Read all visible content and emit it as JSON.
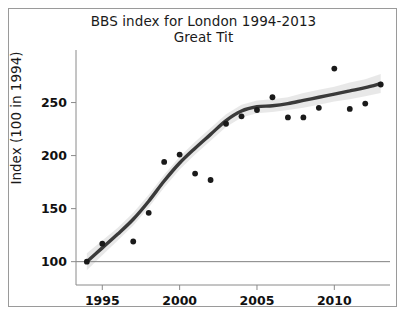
{
  "chart_data": {
    "type": "scatter",
    "title": "BBS index for London 1994-2013",
    "subtitle": "Great Tit",
    "xlabel": "",
    "ylabel": "Index (100 in 1994)",
    "xlim": [
      1993.3,
      2013.6
    ],
    "ylim": [
      78,
      292
    ],
    "grid": false,
    "legend": null,
    "xticks": [
      1995,
      2000,
      2005,
      2010
    ],
    "xtick_labels": [
      "1995",
      "2000",
      "2005",
      "2010"
    ],
    "yticks": [
      100,
      150,
      200,
      250
    ],
    "ytick_labels": [
      "100",
      "150",
      "200",
      "250"
    ],
    "reference_line": {
      "y": 100,
      "color": "#808080",
      "label": ""
    },
    "x": [
      1994,
      1995,
      1997,
      1998,
      1999,
      2000,
      2001,
      2002,
      2003,
      2004,
      2005,
      2006,
      2007,
      2008,
      2009,
      2010,
      2011,
      2012,
      2013
    ],
    "values": [
      100,
      117,
      119,
      146,
      194,
      201,
      183,
      177,
      230,
      237,
      243,
      255,
      236,
      236,
      245,
      282,
      244,
      249,
      267
    ],
    "series": [
      {
        "name": "Annual index",
        "marker": "filled-circle",
        "color": "#1a1a1a",
        "x": [
          1994,
          1995,
          1997,
          1998,
          1999,
          2000,
          2001,
          2002,
          2003,
          2004,
          2005,
          2006,
          2007,
          2008,
          2009,
          2010,
          2011,
          2012,
          2013
        ],
        "values": [
          100,
          117,
          119,
          146,
          194,
          201,
          183,
          177,
          230,
          237,
          243,
          255,
          236,
          236,
          245,
          282,
          244,
          249,
          267
        ]
      },
      {
        "name": "Smoothed trend",
        "marker": "none",
        "type": "line",
        "color": "#3a3a3a",
        "x": [
          1994,
          1995,
          1996,
          1997,
          1998,
          1999,
          2000,
          2001,
          2002,
          2003,
          2004,
          2005,
          2006,
          2007,
          2008,
          2009,
          2010,
          2011,
          2012,
          2013
        ],
        "values": [
          100,
          113,
          126,
          140,
          157,
          176,
          193,
          207,
          220,
          233,
          242,
          246,
          247,
          249,
          252,
          255,
          258,
          261,
          264,
          268
        ]
      },
      {
        "name": "Confidence band",
        "type": "band",
        "color": "#e4e4e4",
        "x": [
          1994,
          1995,
          1996,
          1997,
          1998,
          1999,
          2000,
          2001,
          2002,
          2003,
          2004,
          2005,
          2006,
          2007,
          2008,
          2009,
          2010,
          2011,
          2012,
          2013
        ],
        "lower": [
          92,
          106,
          120,
          134,
          151,
          170,
          187,
          201,
          214,
          227,
          236,
          240,
          241,
          243,
          245,
          248,
          251,
          253,
          256,
          259
        ],
        "upper": [
          108,
          120,
          132,
          146,
          163,
          182,
          199,
          213,
          226,
          239,
          248,
          252,
          253,
          255,
          259,
          262,
          265,
          269,
          272,
          277
        ]
      }
    ]
  },
  "figure": {
    "title_line1": "BBS index for London 1994-2013",
    "title_line2": "Great Tit",
    "y_axis_title": "Index (100 in 1994)"
  }
}
